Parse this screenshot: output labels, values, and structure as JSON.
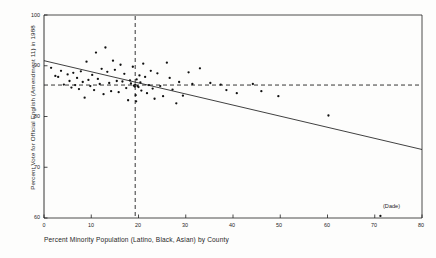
{
  "figure": {
    "background": "#fdfdfc",
    "ink_color": "#1f1f1f"
  },
  "axis": {
    "y_title": "Percent Vote for Official English (Amendment 11) in 1988",
    "x_title": "Percent Minority Population (Latino, Black, Asian) by County",
    "y_ticks": [
      "100",
      "90",
      "80",
      "70",
      "60"
    ],
    "x_ticks": [
      "0",
      "10",
      "20",
      "30",
      "40",
      "50",
      "60",
      "70",
      "80"
    ]
  },
  "annotations": {
    "dade": "(Dade)"
  },
  "chart_data": {
    "type": "scatter",
    "title": "",
    "xlabel": "Percent Minority Population (Latino, Black, Asian) by County",
    "ylabel": "Percent Vote for Official English (Amendment 11) in 1988",
    "xlim": [
      0,
      80
    ],
    "ylim": [
      60,
      100
    ],
    "xticks": [
      0,
      10,
      20,
      30,
      40,
      50,
      60,
      70,
      80
    ],
    "yticks": [
      60,
      70,
      80,
      90,
      100
    ],
    "grid": false,
    "legend": "none",
    "marker": "filled-dot",
    "marker_color": "#111111",
    "points": [
      [
        1.5,
        89.6
      ],
      [
        2.4,
        88.0
      ],
      [
        3.0,
        87.8
      ],
      [
        3.6,
        89.0
      ],
      [
        4.2,
        86.3
      ],
      [
        5.0,
        88.3
      ],
      [
        5.4,
        87.0
      ],
      [
        5.8,
        85.7
      ],
      [
        6.2,
        88.6
      ],
      [
        6.6,
        86.2
      ],
      [
        7.0,
        87.6
      ],
      [
        7.4,
        85.4
      ],
      [
        7.8,
        88.9
      ],
      [
        8.2,
        86.8
      ],
      [
        8.6,
        83.7
      ],
      [
        9.0,
        90.8
      ],
      [
        9.4,
        87.2
      ],
      [
        9.8,
        86.0
      ],
      [
        10.2,
        88.2
      ],
      [
        10.6,
        85.2
      ],
      [
        11.0,
        92.6
      ],
      [
        11.4,
        87.4
      ],
      [
        11.8,
        86.4
      ],
      [
        12.2,
        89.4
      ],
      [
        12.6,
        84.4
      ],
      [
        13.0,
        93.6
      ],
      [
        13.4,
        88.8
      ],
      [
        13.8,
        86.6
      ],
      [
        14.2,
        85.0
      ],
      [
        14.6,
        91.0
      ],
      [
        15.0,
        89.2
      ],
      [
        15.4,
        87.0
      ],
      [
        15.8,
        84.8
      ],
      [
        16.2,
        90.2
      ],
      [
        16.6,
        86.9
      ],
      [
        17.0,
        88.4
      ],
      [
        17.4,
        85.6
      ],
      [
        17.8,
        83.2
      ],
      [
        18.2,
        87.1
      ],
      [
        18.4,
        86.5
      ],
      [
        18.8,
        89.8
      ],
      [
        19.0,
        86.1
      ],
      [
        19.2,
        85.9
      ],
      [
        19.3,
        86.3
      ],
      [
        19.4,
        84.2
      ],
      [
        19.5,
        83.0
      ],
      [
        19.6,
        87.3
      ],
      [
        19.8,
        86.0
      ],
      [
        20.0,
        85.8
      ],
      [
        20.2,
        88.1
      ],
      [
        20.4,
        86.7
      ],
      [
        20.6,
        85.1
      ],
      [
        21.0,
        90.4
      ],
      [
        21.4,
        87.8
      ],
      [
        21.8,
        84.6
      ],
      [
        22.2,
        86.2
      ],
      [
        22.6,
        89.0
      ],
      [
        23.0,
        85.5
      ],
      [
        23.4,
        83.5
      ],
      [
        24.0,
        88.5
      ],
      [
        24.6,
        86.0
      ],
      [
        25.2,
        84.0
      ],
      [
        26.0,
        90.6
      ],
      [
        26.6,
        87.6
      ],
      [
        27.2,
        85.3
      ],
      [
        28.0,
        82.6
      ],
      [
        28.6,
        86.8
      ],
      [
        29.4,
        84.1
      ],
      [
        30.6,
        88.7
      ],
      [
        31.4,
        86.4
      ],
      [
        33.0,
        89.5
      ],
      [
        35.2,
        86.6
      ],
      [
        37.4,
        86.3
      ],
      [
        38.6,
        85.2
      ],
      [
        40.8,
        84.6
      ],
      [
        44.2,
        86.4
      ],
      [
        46.0,
        85.0
      ],
      [
        49.6,
        84.0
      ],
      [
        60.2,
        80.2
      ],
      [
        71.2,
        60.4
      ]
    ],
    "regression_line": {
      "x": [
        0,
        80
      ],
      "y": [
        91.0,
        73.5
      ],
      "style": "solid"
    },
    "reference_lines": [
      {
        "orientation": "vertical",
        "value": 19.3,
        "style": "dashed"
      },
      {
        "orientation": "horizontal",
        "value": 86.2,
        "style": "dashed"
      }
    ]
  }
}
